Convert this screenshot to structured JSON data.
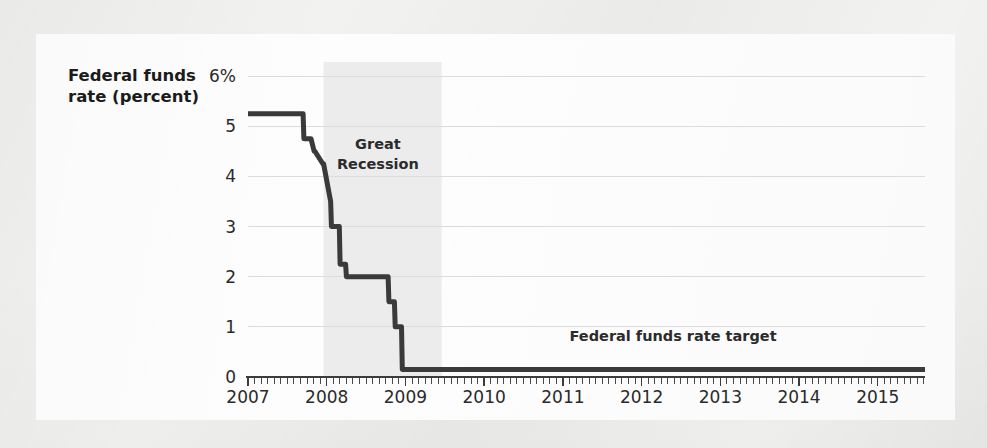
{
  "figure": {
    "background_color": "#f2f2f1",
    "card_color": "#fdfdfd",
    "line_color": "#3a3a3a",
    "grid_color": "#dcdcdc",
    "band_color": "#ececec"
  },
  "axis": {
    "y_title_line1": "Federal funds",
    "y_title_line2": "rate (percent)",
    "y_ticks": [
      "6%",
      "5",
      "4",
      "3",
      "2",
      "1",
      "0"
    ],
    "y_values": [
      6,
      5,
      4,
      3,
      2,
      1,
      0
    ],
    "x_ticks": [
      "2007",
      "2008",
      "2009",
      "2010",
      "2011",
      "2012",
      "2013",
      "2014",
      "2015"
    ],
    "x_values": [
      2007,
      2008,
      2009,
      2010,
      2011,
      2012,
      2013,
      2014,
      2015
    ]
  },
  "annotations": [
    {
      "name": "great-recession",
      "line1": "Great",
      "line2": "Recession",
      "x_center": 2008.65,
      "y_top": 4.55
    },
    {
      "name": "federal-funds-rate-target",
      "text": "Federal funds rate target",
      "x_center": 2012.4,
      "y": 0.72
    }
  ],
  "chart_data": {
    "type": "line",
    "title": "",
    "xlabel": "",
    "ylabel": "Federal funds rate (percent)",
    "xlim": [
      2007.0,
      2015.6
    ],
    "ylim": [
      0,
      6
    ],
    "yticks": [
      0,
      1,
      2,
      3,
      4,
      5,
      6
    ],
    "ytick_labels": [
      "0",
      "1",
      "2",
      "3",
      "4",
      "5",
      "6%"
    ],
    "xticks": [
      2007,
      2008,
      2009,
      2010,
      2011,
      2012,
      2013,
      2014,
      2015
    ],
    "xtick_labels": [
      "2007",
      "2008",
      "2009",
      "2010",
      "2011",
      "2012",
      "2013",
      "2014",
      "2015"
    ],
    "grid": "horizontal",
    "legend": "none",
    "minor_ticks": "monthly",
    "shaded_regions": [
      {
        "label": "Great Recession",
        "x_start": 2007.96,
        "x_end": 2009.46,
        "color": "#ececec"
      }
    ],
    "series": [
      {
        "name": "Federal funds rate target",
        "color": "#3a3a3a",
        "x": [
          2007.0,
          2007.1,
          2007.2,
          2007.3,
          2007.4,
          2007.5,
          2007.6,
          2007.7,
          2007.71,
          2007.8,
          2007.84,
          2007.85,
          2007.95,
          2007.96,
          2008.05,
          2008.06,
          2008.16,
          2008.17,
          2008.24,
          2008.25,
          2008.33,
          2008.34,
          2008.42,
          2008.5,
          2008.6,
          2008.7,
          2008.78,
          2008.79,
          2008.86,
          2008.87,
          2008.95,
          2008.96,
          2009.1,
          2009.5,
          2010.0,
          2010.5,
          2011.0,
          2011.5,
          2012.0,
          2012.5,
          2013.0,
          2013.5,
          2014.0,
          2014.5,
          2015.0,
          2015.3,
          2015.6
        ],
        "y": [
          5.25,
          5.25,
          5.25,
          5.25,
          5.25,
          5.25,
          5.25,
          5.25,
          4.75,
          4.75,
          4.5,
          4.5,
          4.25,
          4.25,
          3.5,
          3.0,
          3.0,
          2.25,
          2.25,
          2.0,
          2.0,
          2.0,
          2.0,
          2.0,
          2.0,
          2.0,
          2.0,
          1.5,
          1.5,
          1.0,
          1.0,
          0.15,
          0.15,
          0.15,
          0.15,
          0.15,
          0.15,
          0.15,
          0.15,
          0.15,
          0.15,
          0.15,
          0.15,
          0.15,
          0.15,
          0.15,
          0.15
        ]
      }
    ],
    "notable_values": {
      "peak_rate": 5.25,
      "peak_period": "2007 through mid-2007",
      "trough_rate": 0.15,
      "trough_start": "late 2008",
      "recession_start": "December 2007",
      "recession_end": "June 2009"
    }
  }
}
